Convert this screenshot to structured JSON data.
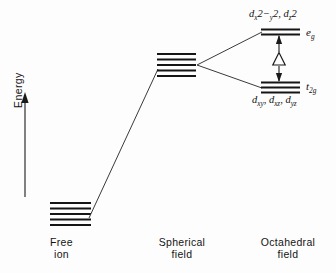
{
  "figure": {
    "kind": "crystal-field-splitting-diagram",
    "background_color": "#fdfdfd",
    "line_color": "#1a1a1a"
  },
  "axis": {
    "energy_label": "Energy",
    "arrow_direction": "up"
  },
  "columns": [
    {
      "id": "free-ion",
      "line1": "Free",
      "line2": "ion"
    },
    {
      "id": "spherical-field",
      "line1": "Spherical",
      "line2": "field"
    },
    {
      "id": "octahedral-field",
      "line1": "Octahedral",
      "line2": "field"
    }
  ],
  "levels": {
    "free_ion": {
      "name": "free-ion-level",
      "degeneracy": 5,
      "line_count": 5
    },
    "spherical_field": {
      "name": "spherical-field-level",
      "degeneracy": 5,
      "line_count": 5
    },
    "eg": {
      "name": "eg-level",
      "term": "e",
      "term_sub": "g",
      "degeneracy": 2,
      "line_count": 2,
      "orbitals": "d_x2-y2, d_z2",
      "orbital_parts": {
        "d1_letter": "d",
        "d1_sub": "x",
        "d1_exp": "2",
        "d1_minus": "−",
        "d1_sub2": "y",
        "d1_exp2": "2",
        "comma": ",",
        "d2_letter": "d",
        "d2_sub": "z",
        "d2_exp": "2"
      }
    },
    "t2g": {
      "name": "t2g-level",
      "term": "t",
      "term_sub": "2g",
      "degeneracy": 3,
      "line_count": 3,
      "orbitals": "d_xy, d_xz, d_yz",
      "orbital_parts": {
        "d1_letter": "d",
        "d1_sub": "xy",
        "comma1": ",",
        "d2_letter": "d",
        "d2_sub": "xz",
        "comma2": ",",
        "d3_letter": "d",
        "d3_sub": "yz"
      }
    }
  },
  "splitting": {
    "name": "delta-splitting-arrow",
    "symbol": "Δ",
    "description": "crystal field splitting energy between t2g and eg"
  }
}
